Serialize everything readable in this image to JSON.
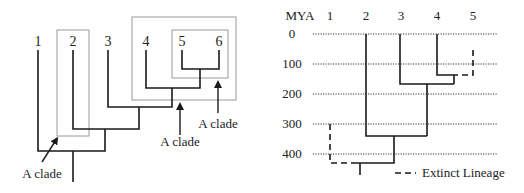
{
  "left_tree": {
    "taxa": [
      "1",
      "2",
      "3",
      "4",
      "5",
      "6"
    ],
    "clade_annotations": [
      {
        "label": "A clade",
        "target": "taxon 2"
      },
      {
        "label": "A clade",
        "target": "taxa 4, 5, 6"
      },
      {
        "label": "A clade",
        "target": "taxa 5, 6"
      }
    ]
  },
  "right_tree": {
    "axis_title": "MYA",
    "axis_ticks": [
      "0",
      "100",
      "200",
      "300",
      "400"
    ],
    "axis_values": [
      0,
      100,
      200,
      300,
      400
    ],
    "taxa": [
      "1",
      "2",
      "3",
      "4",
      "5"
    ],
    "extinct_taxa": [
      "1",
      "5"
    ],
    "legend": {
      "label": "Extinct Lineage"
    }
  }
}
